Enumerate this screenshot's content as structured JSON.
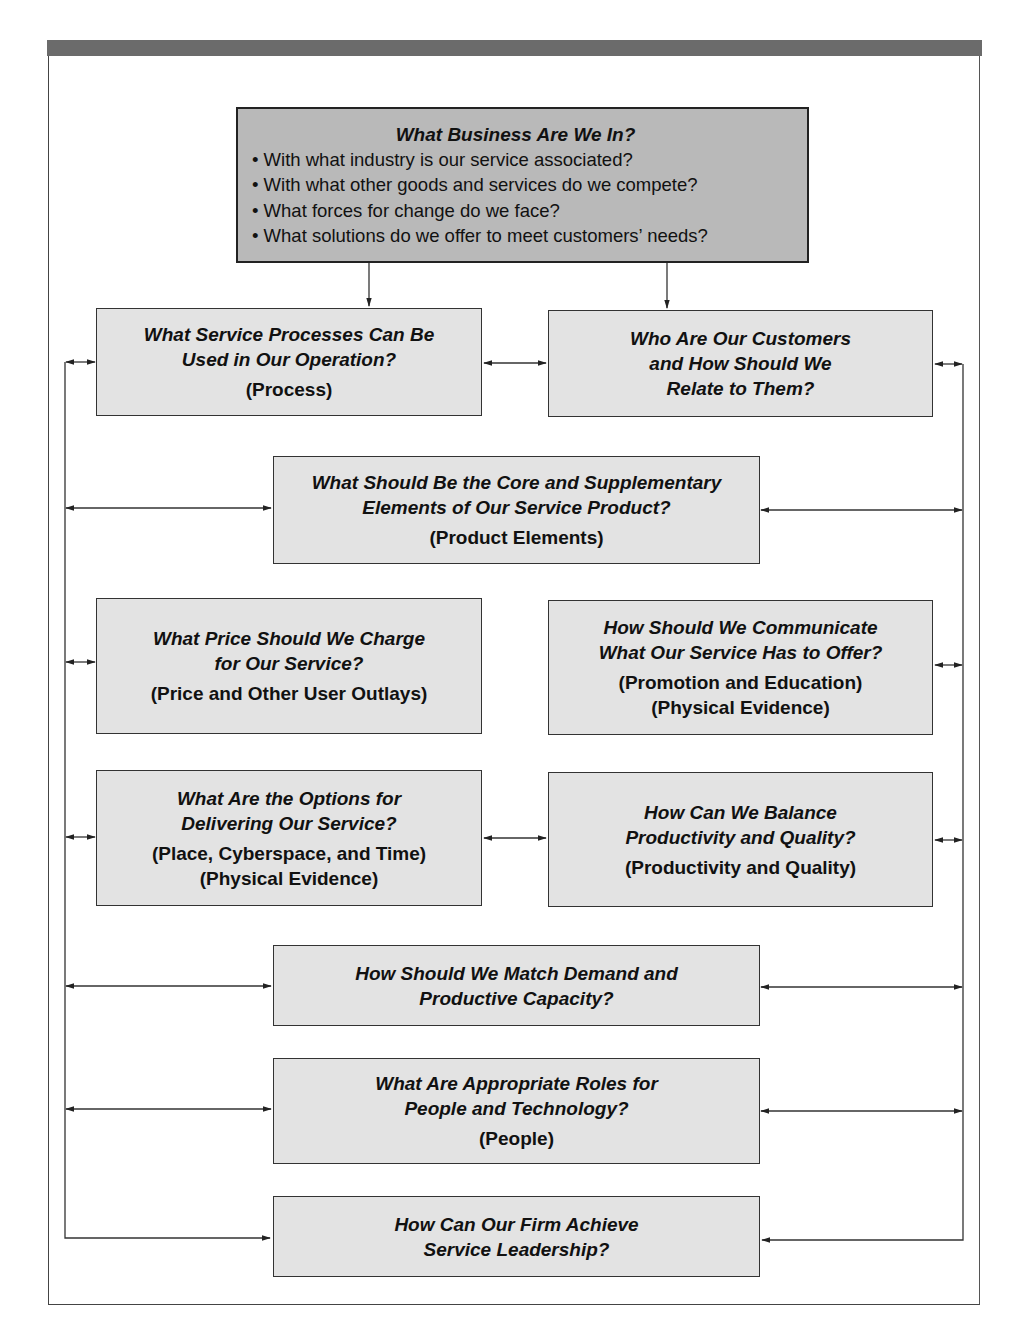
{
  "diagram": {
    "top": {
      "title": "What Business Are We In?",
      "bullets": [
        "• With what industry is our service associated?",
        "• With what other goods and services do we compete?",
        "• What forces for change do we face?",
        "• What solutions do we offer to meet customers’ needs?"
      ]
    },
    "boxes": [
      {
        "id": "process",
        "question": [
          "What Service Processes Can Be",
          "Used in Our Operation?"
        ],
        "labels": [
          "(Process)"
        ]
      },
      {
        "id": "customers",
        "question": [
          "Who Are Our Customers",
          "and How Should We",
          "Relate to Them?"
        ],
        "labels": []
      },
      {
        "id": "product",
        "question": [
          "What Should Be the Core and Supplementary",
          "Elements of Our Service Product?"
        ],
        "labels": [
          "(Product Elements)"
        ]
      },
      {
        "id": "price",
        "question": [
          "What Price Should We Charge",
          "for Our Service?"
        ],
        "labels": [
          "(Price and Other User Outlays)"
        ]
      },
      {
        "id": "promotion",
        "question": [
          "How Should We Communicate",
          "What Our Service Has to Offer?"
        ],
        "labels": [
          "(Promotion and Education)",
          "(Physical Evidence)"
        ]
      },
      {
        "id": "place",
        "question": [
          "What Are the Options for",
          "Delivering Our Service?"
        ],
        "labels": [
          "(Place, Cyberspace, and Time)",
          "(Physical Evidence)"
        ]
      },
      {
        "id": "productivity",
        "question": [
          "How Can We Balance",
          "Productivity and Quality?"
        ],
        "labels": [
          "(Productivity and Quality)"
        ]
      },
      {
        "id": "demand",
        "question": [
          "How Should We Match Demand and",
          "Productive Capacity?"
        ],
        "labels": []
      },
      {
        "id": "people",
        "question": [
          "What Are Appropriate Roles for",
          "People and Technology?"
        ],
        "labels": [
          "(People)"
        ]
      },
      {
        "id": "leadership",
        "question": [
          "How Can Our Firm Achieve",
          "Service Leadership?"
        ],
        "labels": []
      }
    ]
  },
  "colors": {
    "header_bar": "#6b6b6b",
    "top_box_fill": "#b9b9b9",
    "box_fill": "#e3e3e3",
    "line": "#333333"
  }
}
